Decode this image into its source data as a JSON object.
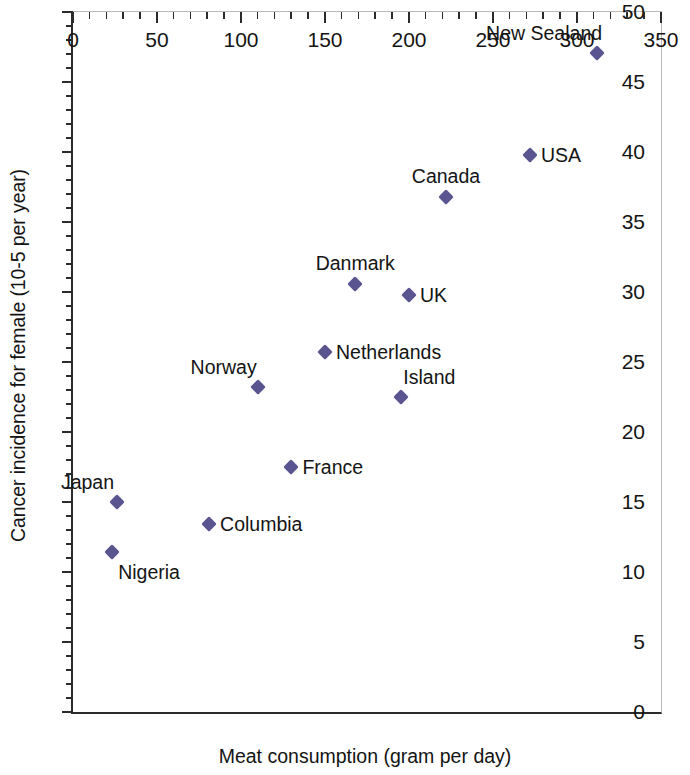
{
  "chart_data": {
    "type": "scatter",
    "title": "",
    "xlabel": "Meat consumption (gram per day)",
    "ylabel": "Cancer incidence for female (10-5 per year)",
    "xlim": [
      0,
      350
    ],
    "ylim": [
      0,
      50
    ],
    "xticks": [
      0,
      50,
      100,
      150,
      200,
      250,
      300,
      350
    ],
    "yticks": [
      0,
      5,
      10,
      15,
      20,
      25,
      30,
      35,
      40,
      45,
      50
    ],
    "x_minor_step": 10,
    "y_minor_step": 1,
    "grid": false,
    "legend": null,
    "marker": "diamond",
    "marker_color": "#5a5490",
    "points": [
      {
        "label": "Nigeria",
        "x": 23,
        "y": 11.4,
        "label_pos": "below-right"
      },
      {
        "label": "Japan",
        "x": 26,
        "y": 15.0,
        "label_pos": "above-left"
      },
      {
        "label": "Columbia",
        "x": 81,
        "y": 13.4,
        "label_pos": "right"
      },
      {
        "label": "Norway",
        "x": 110,
        "y": 23.2,
        "label_pos": "above-left"
      },
      {
        "label": "France",
        "x": 130,
        "y": 17.5,
        "label_pos": "right"
      },
      {
        "label": "Netherlands",
        "x": 150,
        "y": 25.7,
        "label_pos": "right"
      },
      {
        "label": "Danmark",
        "x": 168,
        "y": 30.6,
        "label_pos": "above"
      },
      {
        "label": "Island",
        "x": 195,
        "y": 22.5,
        "label_pos": "above-right"
      },
      {
        "label": "UK",
        "x": 200,
        "y": 29.8,
        "label_pos": "right"
      },
      {
        "label": "Canada",
        "x": 222,
        "y": 36.8,
        "label_pos": "above"
      },
      {
        "label": "USA",
        "x": 272,
        "y": 39.8,
        "label_pos": "right"
      },
      {
        "label": "New Sealand",
        "x": 312,
        "y": 47.1,
        "label_pos": "above-left"
      }
    ]
  },
  "axes": {
    "x_title": "Meat consumption (gram per day)",
    "y_title": "Cancer incidence for female (10-5 per year)"
  },
  "colors": {
    "marker": "#5a5490",
    "axis": "#2b2b2b",
    "text": "#141414",
    "frame_light": "#b9b9b9"
  }
}
